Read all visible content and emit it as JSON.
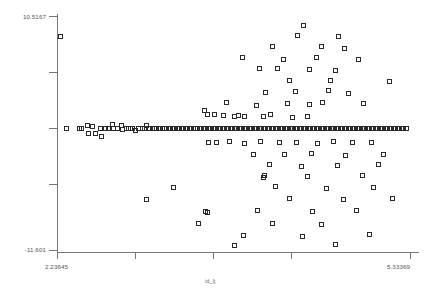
{
  "chart_data": {
    "type": "scatter",
    "title": "",
    "xlabel": "id_lj",
    "ylabel": "",
    "xlim": [
      2.23645,
      5.33369
    ],
    "ylim": [
      -11.601,
      10.5167
    ],
    "grid": false,
    "legend": null,
    "marker": {
      "shape": "open-square",
      "size_px": 5,
      "edge_color": "#2a2a2a",
      "fill": "none"
    },
    "x_tick_labels": [
      "2.23645",
      "5.33369"
    ],
    "y_tick_labels": [
      "10.5167",
      "-11.601"
    ],
    "x_tick_count": 5,
    "y_tick_count": 5,
    "n_points": 178,
    "points": [
      [
        2.27,
        8.6
      ],
      [
        2.32,
        -0.1
      ],
      [
        2.43,
        -0.1
      ],
      [
        2.455,
        -0.1
      ],
      [
        2.5,
        0.2
      ],
      [
        2.515,
        -0.55
      ],
      [
        2.545,
        0.1
      ],
      [
        2.575,
        -0.55
      ],
      [
        2.62,
        -0.1
      ],
      [
        2.625,
        -0.85
      ],
      [
        2.66,
        -0.1
      ],
      [
        2.69,
        -0.1
      ],
      [
        2.72,
        0.3
      ],
      [
        2.735,
        -0.1
      ],
      [
        2.77,
        -0.1
      ],
      [
        2.8,
        0.2
      ],
      [
        2.815,
        -0.2
      ],
      [
        2.845,
        -0.1
      ],
      [
        2.86,
        -0.1
      ],
      [
        2.88,
        -0.1
      ],
      [
        2.9,
        -0.1
      ],
      [
        2.925,
        -0.35
      ],
      [
        2.955,
        -0.1
      ],
      [
        2.985,
        -0.1
      ],
      [
        3.0,
        -0.1
      ],
      [
        3.02,
        0.2
      ],
      [
        3.045,
        -0.1
      ],
      [
        3.07,
        -0.1
      ],
      [
        3.09,
        -0.1
      ],
      [
        3.11,
        -0.1
      ],
      [
        3.135,
        -0.1
      ],
      [
        3.16,
        -0.1
      ],
      [
        3.18,
        -0.1
      ],
      [
        3.2,
        -0.1
      ],
      [
        3.225,
        -0.1
      ],
      [
        3.25,
        -0.1
      ],
      [
        3.27,
        -0.1
      ],
      [
        3.29,
        -0.1
      ],
      [
        3.315,
        -0.1
      ],
      [
        3.34,
        -0.1
      ],
      [
        3.36,
        -0.1
      ],
      [
        3.385,
        -0.1
      ],
      [
        3.405,
        -0.1
      ],
      [
        3.43,
        -0.1
      ],
      [
        3.45,
        -0.1
      ],
      [
        3.47,
        -0.1
      ],
      [
        3.495,
        -0.1
      ],
      [
        3.52,
        -0.1
      ],
      [
        3.54,
        -0.1
      ],
      [
        3.565,
        -0.1
      ],
      [
        3.585,
        -0.1
      ],
      [
        3.61,
        -0.1
      ],
      [
        3.63,
        -0.1
      ],
      [
        3.655,
        -0.1
      ],
      [
        3.675,
        -0.1
      ],
      [
        3.7,
        -0.1
      ],
      [
        3.72,
        -0.1
      ],
      [
        3.745,
        -0.1
      ],
      [
        3.765,
        -0.1
      ],
      [
        3.79,
        -0.1
      ],
      [
        3.81,
        -0.1
      ],
      [
        3.835,
        -0.1
      ],
      [
        3.855,
        -0.1
      ],
      [
        3.88,
        -0.1
      ],
      [
        3.9,
        -0.1
      ],
      [
        3.925,
        -0.1
      ],
      [
        3.945,
        -0.1
      ],
      [
        3.97,
        -0.1
      ],
      [
        3.99,
        -0.1
      ],
      [
        4.015,
        -0.1
      ],
      [
        4.035,
        -0.1
      ],
      [
        4.06,
        -0.1
      ],
      [
        4.08,
        -0.1
      ],
      [
        4.105,
        -0.1
      ],
      [
        4.125,
        -0.1
      ],
      [
        4.15,
        -0.1
      ],
      [
        4.17,
        -0.1
      ],
      [
        4.195,
        -0.1
      ],
      [
        4.215,
        -0.1
      ],
      [
        4.24,
        -0.1
      ],
      [
        4.26,
        -0.1
      ],
      [
        4.285,
        -0.1
      ],
      [
        4.305,
        -0.1
      ],
      [
        4.33,
        -0.1
      ],
      [
        4.35,
        -0.1
      ],
      [
        4.375,
        -0.1
      ],
      [
        4.395,
        -0.1
      ],
      [
        4.42,
        -0.1
      ],
      [
        4.44,
        -0.1
      ],
      [
        4.465,
        -0.1
      ],
      [
        4.485,
        -0.1
      ],
      [
        4.51,
        -0.1
      ],
      [
        4.53,
        -0.1
      ],
      [
        4.555,
        -0.1
      ],
      [
        4.575,
        -0.1
      ],
      [
        4.6,
        -0.1
      ],
      [
        4.62,
        -0.1
      ],
      [
        4.645,
        -0.1
      ],
      [
        4.665,
        -0.1
      ],
      [
        4.69,
        -0.1
      ],
      [
        4.71,
        -0.1
      ],
      [
        4.735,
        -0.1
      ],
      [
        4.755,
        -0.1
      ],
      [
        4.78,
        -0.1
      ],
      [
        4.8,
        -0.1
      ],
      [
        4.825,
        -0.1
      ],
      [
        4.845,
        -0.1
      ],
      [
        4.87,
        -0.1
      ],
      [
        4.89,
        -0.1
      ],
      [
        4.915,
        -0.1
      ],
      [
        4.935,
        -0.1
      ],
      [
        4.96,
        -0.1
      ],
      [
        4.98,
        -0.1
      ],
      [
        5.005,
        -0.1
      ],
      [
        5.03,
        -0.1
      ],
      [
        5.05,
        -0.1
      ],
      [
        5.075,
        -0.1
      ],
      [
        5.095,
        -0.1
      ],
      [
        5.12,
        -0.1
      ],
      [
        5.14,
        -0.1
      ],
      [
        5.165,
        -0.1
      ],
      [
        5.19,
        -0.1
      ],
      [
        5.21,
        -0.1
      ],
      [
        5.235,
        -0.1
      ],
      [
        5.255,
        -0.1
      ],
      [
        5.28,
        -0.1
      ],
      [
        5.3,
        -0.1
      ],
      [
        3.53,
        1.55
      ],
      [
        3.56,
        1.25
      ],
      [
        3.615,
        1.25
      ],
      [
        3.7,
        1.15
      ],
      [
        3.79,
        1.0
      ],
      [
        3.83,
        1.15
      ],
      [
        3.88,
        1.05
      ],
      [
        4.05,
        1.05
      ],
      [
        4.11,
        1.2
      ],
      [
        4.3,
        0.95
      ],
      [
        4.43,
        1.0
      ],
      [
        3.72,
        2.35
      ],
      [
        3.99,
        2.1
      ],
      [
        4.26,
        2.2
      ],
      [
        4.45,
        2.15
      ],
      [
        4.57,
        2.35
      ],
      [
        4.93,
        2.2
      ],
      [
        4.07,
        3.3
      ],
      [
        4.33,
        3.35
      ],
      [
        4.62,
        3.5
      ],
      [
        4.79,
        3.2
      ],
      [
        4.28,
        4.4
      ],
      [
        4.64,
        4.45
      ],
      [
        5.155,
        4.3
      ],
      [
        4.01,
        5.6
      ],
      [
        4.17,
        5.55
      ],
      [
        4.455,
        5.45
      ],
      [
        4.68,
        5.4
      ],
      [
        3.86,
        6.6
      ],
      [
        4.22,
        6.45
      ],
      [
        4.51,
        6.55
      ],
      [
        4.88,
        6.4
      ],
      [
        4.13,
        7.65
      ],
      [
        4.56,
        7.6
      ],
      [
        4.76,
        7.45
      ],
      [
        4.35,
        8.7
      ],
      [
        4.71,
        8.55
      ],
      [
        4.4,
        9.6
      ],
      [
        3.57,
        -1.45
      ],
      [
        3.64,
        -1.4
      ],
      [
        3.75,
        -1.3
      ],
      [
        3.88,
        -1.5
      ],
      [
        4.02,
        -1.35
      ],
      [
        4.19,
        -1.45
      ],
      [
        4.34,
        -1.4
      ],
      [
        4.52,
        -1.55
      ],
      [
        4.66,
        -1.35
      ],
      [
        4.83,
        -1.45
      ],
      [
        5.0,
        -1.4
      ],
      [
        3.96,
        -2.55
      ],
      [
        4.23,
        -2.6
      ],
      [
        4.47,
        -2.5
      ],
      [
        4.77,
        -2.65
      ],
      [
        5.1,
        -2.55
      ],
      [
        4.1,
        -3.55
      ],
      [
        4.38,
        -3.7
      ],
      [
        4.7,
        -3.6
      ],
      [
        5.06,
        -3.5
      ],
      [
        4.06,
        -4.6
      ],
      [
        4.05,
        -4.75
      ],
      [
        4.43,
        -4.65
      ],
      [
        4.92,
        -4.55
      ],
      [
        3.26,
        -5.7
      ],
      [
        4.15,
        -5.6
      ],
      [
        4.6,
        -5.75
      ],
      [
        5.01,
        -5.65
      ],
      [
        3.02,
        -6.8
      ],
      [
        4.28,
        -6.7
      ],
      [
        4.75,
        -6.85
      ],
      [
        5.18,
        -6.75
      ],
      [
        3.54,
        -7.95
      ],
      [
        3.555,
        -8.05
      ],
      [
        4.0,
        -7.9
      ],
      [
        4.48,
        -8.0
      ],
      [
        4.86,
        -7.85
      ],
      [
        3.48,
        -9.1
      ],
      [
        4.13,
        -9.05
      ],
      [
        4.56,
        -9.2
      ],
      [
        3.87,
        -10.2
      ],
      [
        4.39,
        -10.3
      ],
      [
        4.98,
        -10.15
      ],
      [
        3.79,
        -11.2
      ],
      [
        4.68,
        -11.1
      ]
    ]
  }
}
